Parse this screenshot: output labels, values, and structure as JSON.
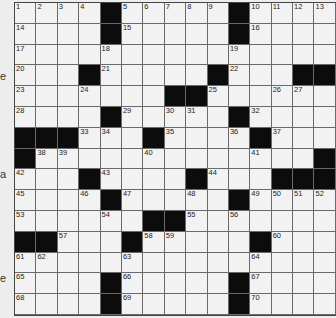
{
  "puzzle": {
    "rows": 15,
    "cols": 15,
    "black_color": "#0c0c0c",
    "grid": [
      [
        "1",
        "2",
        "3",
        "4",
        "#",
        "5",
        "6",
        "7",
        "8",
        "9",
        "#",
        "10",
        "11",
        "12",
        "13"
      ],
      [
        "14",
        "",
        "",
        "",
        "#",
        "15",
        "",
        "",
        "",
        "",
        "#",
        "16",
        "",
        "",
        ""
      ],
      [
        "17",
        "",
        "",
        "",
        "18",
        "",
        "",
        "",
        "",
        "",
        "19",
        "",
        "",
        "",
        ""
      ],
      [
        "20",
        "",
        "",
        "#",
        "21",
        "",
        "",
        "",
        "",
        "#",
        "22",
        "",
        "",
        "#",
        "#"
      ],
      [
        "23",
        "",
        "",
        "24",
        "",
        "",
        "",
        "#",
        "#",
        "25",
        "",
        "",
        "26",
        "27",
        ""
      ],
      [
        "28",
        "",
        "",
        "",
        "#",
        "29",
        "",
        "30",
        "31",
        "",
        "#",
        "32",
        "",
        "",
        ""
      ],
      [
        "#",
        "#",
        "#",
        "33",
        "34",
        "",
        "#",
        "35",
        "",
        "",
        "36",
        "#",
        "37",
        "",
        ""
      ],
      [
        "#",
        "38",
        "39",
        "",
        "",
        "",
        "40",
        "",
        "",
        "",
        "",
        "41",
        "",
        "",
        "#"
      ],
      [
        "42",
        "",
        "",
        "#",
        "43",
        "",
        "",
        "",
        "#",
        "44",
        "",
        "",
        "#",
        "#",
        "#"
      ],
      [
        "45",
        "",
        "",
        "46",
        "#",
        "47",
        "",
        "",
        "48",
        "",
        "#",
        "49",
        "50",
        "51",
        "52"
      ],
      [
        "53",
        "",
        "",
        "",
        "54",
        "",
        "#",
        "#",
        "55",
        "",
        "56",
        "",
        "",
        "",
        ""
      ],
      [
        "#",
        "#",
        "57",
        "",
        "",
        "#",
        "58",
        "59",
        "",
        "",
        "",
        "#",
        "60",
        "",
        ""
      ],
      [
        "61",
        "62",
        "",
        "",
        "",
        "63",
        "",
        "",
        "",
        "",
        "",
        "64",
        "",
        "",
        ""
      ],
      [
        "65",
        "",
        "",
        "",
        "#",
        "66",
        "",
        "",
        "",
        "",
        "#",
        "67",
        "",
        "",
        ""
      ],
      [
        "68",
        "",
        "",
        "",
        "#",
        "69",
        "",
        "",
        "",
        "",
        "#",
        "70",
        "",
        "",
        ""
      ]
    ]
  },
  "edge_fragments": [
    {
      "text": "e",
      "top": 71
    },
    {
      "text": "a",
      "top": 169
    },
    {
      "text": "e",
      "top": 273
    }
  ]
}
